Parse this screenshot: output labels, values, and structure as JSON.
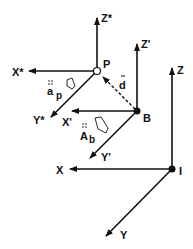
{
  "diagram": {
    "type": "coordinate-frames",
    "colors": {
      "line": "#111111",
      "background": "#ffffff"
    },
    "frames": [
      {
        "origin_label": "P",
        "origin_style": "hollow",
        "axes": {
          "x": "X*",
          "y": "Y*",
          "z": "Z*"
        }
      },
      {
        "origin_label": "B",
        "origin_style": "filled",
        "axes": {
          "x": "X'",
          "y": "Y'",
          "z": "Z'"
        }
      },
      {
        "origin_label": "I",
        "origin_style": "filled",
        "axes": {
          "x": "X",
          "y": "Y",
          "z": "Z"
        }
      }
    ],
    "vectors": [
      {
        "label": "d",
        "from": "B",
        "to": "P",
        "style": "dashed"
      }
    ],
    "annotations": [
      {
        "label": "a",
        "subscript": "p",
        "marker": "dots"
      },
      {
        "label": "A",
        "subscript": "b",
        "marker": "dots"
      }
    ],
    "labels": {
      "P": "P",
      "B": "B",
      "I": "I",
      "Xstar": "X*",
      "Ystar": "Y*",
      "Zstar": "Z*",
      "Xprime": "X'",
      "Yprime": "Y'",
      "Zprime": "Z'",
      "X": "X",
      "Y": "Y",
      "Z": "Z",
      "d": "d",
      "a": "a",
      "p": "p",
      "A": "A",
      "b": "b"
    }
  }
}
